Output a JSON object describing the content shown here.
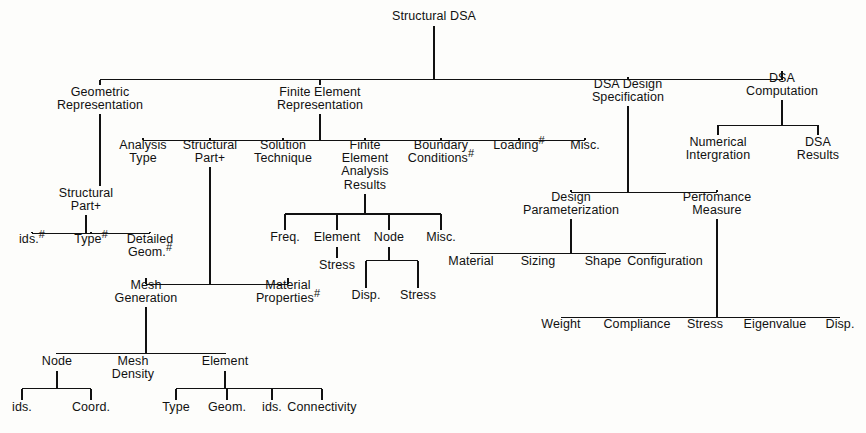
{
  "diagram": {
    "title": "Structural DSA",
    "type": "hierarchy-tree",
    "nodes": [
      {
        "id": "root",
        "label": "Structural DSA",
        "lines": [
          "Structural DSA"
        ],
        "x": 434,
        "y": 10,
        "level": 0
      },
      {
        "id": "geom",
        "label": "Geometric Representation",
        "lines": [
          "Geometric",
          "Representation"
        ],
        "x": 100,
        "y": 86,
        "level": 1
      },
      {
        "id": "fe",
        "label": "Finite Element Representation",
        "lines": [
          "Finite Element",
          "Representation"
        ],
        "x": 320,
        "y": 86,
        "level": 1
      },
      {
        "id": "dsaspec",
        "label": "DSA Design Specification",
        "lines": [
          "DSA Design",
          "Specification"
        ],
        "x": 628,
        "y": 78,
        "level": 1
      },
      {
        "id": "dsacomp",
        "label": "DSA Computation",
        "lines": [
          "DSA",
          "Computation"
        ],
        "x": 782,
        "y": 72,
        "level": 1
      },
      {
        "id": "numint",
        "label": "Numerical Intergration",
        "lines": [
          "Numerical",
          "Intergration"
        ],
        "x": 718,
        "y": 136,
        "level": 2
      },
      {
        "id": "dsares",
        "label": "DSA Results",
        "lines": [
          "DSA",
          "Results"
        ],
        "x": 818,
        "y": 136,
        "level": 2
      },
      {
        "id": "antype",
        "label": "Analysis Type",
        "lines": [
          "Analysis",
          "Type"
        ],
        "x": 143,
        "y": 139,
        "level": 2
      },
      {
        "id": "fesp",
        "label": "Structural Part +",
        "lines": [
          "Structural",
          "Part +"
        ],
        "x": 210,
        "y": 139,
        "level": 2
      },
      {
        "id": "soltech",
        "label": "Solution Technique",
        "lines": [
          "Solution",
          "Technique"
        ],
        "x": 283,
        "y": 139,
        "level": 2
      },
      {
        "id": "fear",
        "label": "Finite Element Analysis Results",
        "lines": [
          "Finite",
          "Element",
          "Analysis",
          "Results"
        ],
        "x": 365,
        "y": 139,
        "level": 2
      },
      {
        "id": "bc",
        "label": "Boundary Conditions #",
        "lines": [
          "Boundary",
          "Conditions #"
        ],
        "x": 441,
        "y": 139,
        "level": 2
      },
      {
        "id": "loading",
        "label": "Loading #",
        "lines": [
          "Loading #"
        ],
        "x": 519,
        "y": 139,
        "level": 2
      },
      {
        "id": "miscfe",
        "label": "Misc.",
        "lines": [
          "Misc."
        ],
        "x": 585,
        "y": 139,
        "level": 2
      },
      {
        "id": "gsp",
        "label": "Structural Part +",
        "lines": [
          "Structural",
          "Part +"
        ],
        "x": 86,
        "y": 187,
        "level": 2
      },
      {
        "id": "ids1",
        "label": "ids. #",
        "lines": [
          "ids. #"
        ],
        "x": 32,
        "y": 233,
        "level": 3
      },
      {
        "id": "type1",
        "label": "Type #",
        "lines": [
          "Type #"
        ],
        "x": 91,
        "y": 233,
        "level": 3
      },
      {
        "id": "detgeom",
        "label": "Detailed Geom. #",
        "lines": [
          "Detailed",
          "Geom. #"
        ],
        "x": 150,
        "y": 233,
        "level": 3
      },
      {
        "id": "freq",
        "label": "Freq.",
        "lines": [
          "Freq."
        ],
        "x": 285,
        "y": 231,
        "level": 3
      },
      {
        "id": "element1",
        "label": "Element",
        "lines": [
          "Element"
        ],
        "x": 337,
        "y": 231,
        "level": 3
      },
      {
        "id": "node1",
        "label": "Node",
        "lines": [
          "Node"
        ],
        "x": 389,
        "y": 231,
        "level": 3
      },
      {
        "id": "miscfear",
        "label": "Misc.",
        "lines": [
          "Misc."
        ],
        "x": 441,
        "y": 231,
        "level": 3
      },
      {
        "id": "estress",
        "label": "Stress",
        "lines": [
          "Stress"
        ],
        "x": 337,
        "y": 259,
        "level": 4
      },
      {
        "id": "ndisp",
        "label": "Disp.",
        "lines": [
          "Disp."
        ],
        "x": 366,
        "y": 289,
        "level": 4
      },
      {
        "id": "nstress",
        "label": "Stress",
        "lines": [
          "Stress"
        ],
        "x": 418,
        "y": 289,
        "level": 4
      },
      {
        "id": "meshgen",
        "label": "Mesh Generation",
        "lines": [
          "Mesh",
          "Generation"
        ],
        "x": 146,
        "y": 279,
        "level": 3
      },
      {
        "id": "matprop",
        "label": "Material Properties #",
        "lines": [
          "Material",
          "Properties #"
        ],
        "x": 288,
        "y": 279,
        "level": 3
      },
      {
        "id": "node2",
        "label": "Node",
        "lines": [
          "Node"
        ],
        "x": 57,
        "y": 355,
        "level": 4
      },
      {
        "id": "meshdens",
        "label": "Mesh Density",
        "lines": [
          "Mesh",
          "Density"
        ],
        "x": 133,
        "y": 355,
        "level": 4
      },
      {
        "id": "element2",
        "label": "Element",
        "lines": [
          "Element"
        ],
        "x": 225,
        "y": 355,
        "level": 4
      },
      {
        "id": "ids2",
        "label": "ids.",
        "lines": [
          "ids."
        ],
        "x": 22,
        "y": 401,
        "level": 5
      },
      {
        "id": "coord",
        "label": "Coord.",
        "lines": [
          "Coord."
        ],
        "x": 91,
        "y": 401,
        "level": 5
      },
      {
        "id": "type2",
        "label": "Type",
        "lines": [
          "Type"
        ],
        "x": 176,
        "y": 401,
        "level": 5
      },
      {
        "id": "geom2",
        "label": "Geom.",
        "lines": [
          "Geom."
        ],
        "x": 227,
        "y": 401,
        "level": 5
      },
      {
        "id": "ids3",
        "label": "ids.",
        "lines": [
          "ids."
        ],
        "x": 272,
        "y": 401,
        "level": 5
      },
      {
        "id": "connect",
        "label": "Connectivity",
        "lines": [
          "Connectivity"
        ],
        "x": 322,
        "y": 401,
        "level": 5
      },
      {
        "id": "designparam",
        "label": "Design Parameterization",
        "lines": [
          "Design",
          "Parameterization"
        ],
        "x": 571,
        "y": 191,
        "level": 2
      },
      {
        "id": "perfmeas",
        "label": "Perfomance Measure",
        "lines": [
          "Perfomance",
          "Measure"
        ],
        "x": 717,
        "y": 191,
        "level": 2
      },
      {
        "id": "material",
        "label": "Material",
        "lines": [
          "Material"
        ],
        "x": 471,
        "y": 255,
        "level": 3
      },
      {
        "id": "sizing",
        "label": "Sizing",
        "lines": [
          "Sizing"
        ],
        "x": 538,
        "y": 255,
        "level": 3
      },
      {
        "id": "shape",
        "label": "Shape",
        "lines": [
          "Shape"
        ],
        "x": 603,
        "y": 255,
        "level": 3
      },
      {
        "id": "config",
        "label": "Configuration",
        "lines": [
          "Configuration"
        ],
        "x": 665,
        "y": 255,
        "level": 3
      },
      {
        "id": "weight",
        "label": "Weight",
        "lines": [
          "Weight"
        ],
        "x": 561,
        "y": 318,
        "level": 3
      },
      {
        "id": "compliance",
        "label": "Compliance",
        "lines": [
          "Compliance"
        ],
        "x": 637,
        "y": 318,
        "level": 3
      },
      {
        "id": "pmstress",
        "label": "Stress",
        "lines": [
          "Stress"
        ],
        "x": 705,
        "y": 318,
        "level": 3
      },
      {
        "id": "eigen",
        "label": "Eigenvalue",
        "lines": [
          "Eigenvalue"
        ],
        "x": 775,
        "y": 318,
        "level": 3
      },
      {
        "id": "pmdisp",
        "label": "Disp.",
        "lines": [
          "Disp."
        ],
        "x": 840,
        "y": 318,
        "level": 3
      }
    ],
    "edges": [
      {
        "from": "root",
        "to": [
          "geom",
          "fe",
          "dsaspec",
          "dsacomp"
        ]
      },
      {
        "from": "dsacomp",
        "to": [
          "numint",
          "dsares"
        ]
      },
      {
        "from": "fe",
        "to": [
          "antype",
          "fesp",
          "soltech",
          "fear",
          "bc",
          "loading",
          "miscfe"
        ]
      },
      {
        "from": "geom",
        "to": [
          "gsp"
        ]
      },
      {
        "from": "gsp",
        "to": [
          "ids1",
          "type1",
          "detgeom"
        ]
      },
      {
        "from": "fear",
        "to": [
          "freq",
          "element1",
          "node1",
          "miscfear"
        ]
      },
      {
        "from": "element1",
        "to": [
          "estress"
        ]
      },
      {
        "from": "node1",
        "to": [
          "ndisp",
          "nstress"
        ]
      },
      {
        "from": "fesp",
        "to": [
          "meshgen",
          "matprop"
        ]
      },
      {
        "from": "meshgen",
        "to": [
          "node2",
          "meshdens",
          "element2"
        ]
      },
      {
        "from": "node2",
        "to": [
          "ids2",
          "coord"
        ]
      },
      {
        "from": "element2",
        "to": [
          "type2",
          "geom2",
          "ids3",
          "connect"
        ]
      },
      {
        "from": "dsaspec",
        "to": [
          "designparam",
          "perfmeas"
        ]
      },
      {
        "from": "designparam",
        "to": [
          "material",
          "sizing",
          "shape",
          "config"
        ]
      },
      {
        "from": "perfmeas",
        "to": [
          "weight",
          "compliance",
          "pmstress",
          "eigen",
          "pmdisp"
        ]
      }
    ],
    "notes": {
      "hash_symbol": "#",
      "plus_symbol": "+",
      "line_color": "#111111",
      "text_color": "#111111",
      "background": "#fdfdfb"
    }
  }
}
